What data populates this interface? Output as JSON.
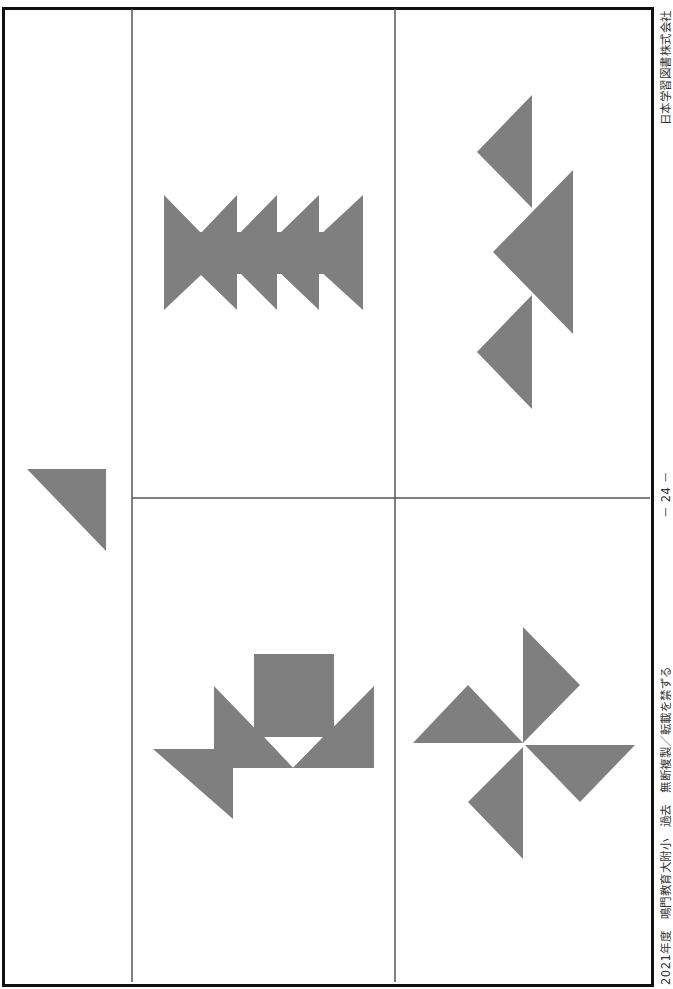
{
  "document": {
    "type": "worksheet-page",
    "side_text": {
      "publisher": "日本学習図書株式会社",
      "page_number": "－ 24 －",
      "copyright": "2021年度　鳴門教育大附小　過去　無断複製／転載を禁ずる"
    },
    "colors": {
      "shape_fill": "#7f7f7f",
      "frame": "#111111",
      "grid_line": "#555555",
      "background": "#ffffff"
    },
    "layout": {
      "columns": 3,
      "rows_in_right_columns": 2,
      "left_cell": "sample-piece",
      "cells": [
        {
          "id": "sample",
          "content": "single right triangle piece"
        },
        {
          "id": "top-middle",
          "content": "chain of bowtie triangles"
        },
        {
          "id": "bottom-middle",
          "content": "square with triangles figure"
        },
        {
          "id": "top-right",
          "content": "three stacked triangles"
        },
        {
          "id": "bottom-right",
          "content": "pinwheel of four triangles"
        }
      ]
    }
  }
}
